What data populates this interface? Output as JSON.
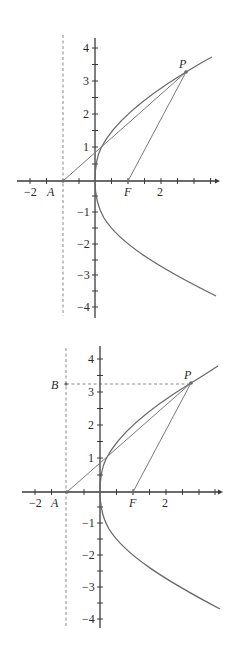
{
  "figures": [
    {
      "id": "top",
      "points": {
        "A": "A",
        "F": "F",
        "P": "P"
      },
      "x_ticks": {
        "neg2": "−2",
        "pos2": "2"
      },
      "y_ticks": {
        "p4": "4",
        "p3": "3",
        "p2": "2",
        "p1": "1",
        "m1": "−1",
        "m2": "−2",
        "m3": "−3",
        "m4": "−4"
      }
    },
    {
      "id": "bottom",
      "points": {
        "A": "A",
        "F": "F",
        "P": "P",
        "B": "B"
      },
      "x_ticks": {
        "neg2": "−2",
        "pos2": "2"
      },
      "y_ticks": {
        "p4": "4",
        "p3": "3",
        "p2": "2",
        "p1": "1",
        "m1": "−1",
        "m2": "−2",
        "m3": "−3",
        "m4": "−4"
      }
    }
  ],
  "colors": {
    "axis": "#3a3a3a",
    "curve": "#6a6a6a",
    "dashed": "#8a8a8a"
  }
}
